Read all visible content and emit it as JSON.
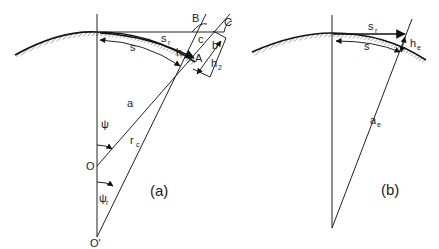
{
  "panels": [
    {
      "id": "a",
      "caption": "(a)",
      "labels": {
        "B": "B",
        "C": "C",
        "c": "c",
        "b": "b",
        "s_r": "s",
        "s_r_sub": "r",
        "s": "s",
        "h": "h",
        "A": "A",
        "h2": "h",
        "h2_sub": "2",
        "a": "a",
        "psi": "ψ",
        "O": "O",
        "r_c": "r",
        "r_c_sub": "c",
        "psi_r": "ψ",
        "psi_r_sub": "r",
        "O_prime": "O'"
      }
    },
    {
      "id": "b",
      "caption": "(b)",
      "labels": {
        "s_r": "s",
        "s_r_sub": "r",
        "s": "s",
        "h_e": "h",
        "h_e_sub": "e",
        "a_e": "a",
        "a_e_sub": "e"
      }
    }
  ]
}
